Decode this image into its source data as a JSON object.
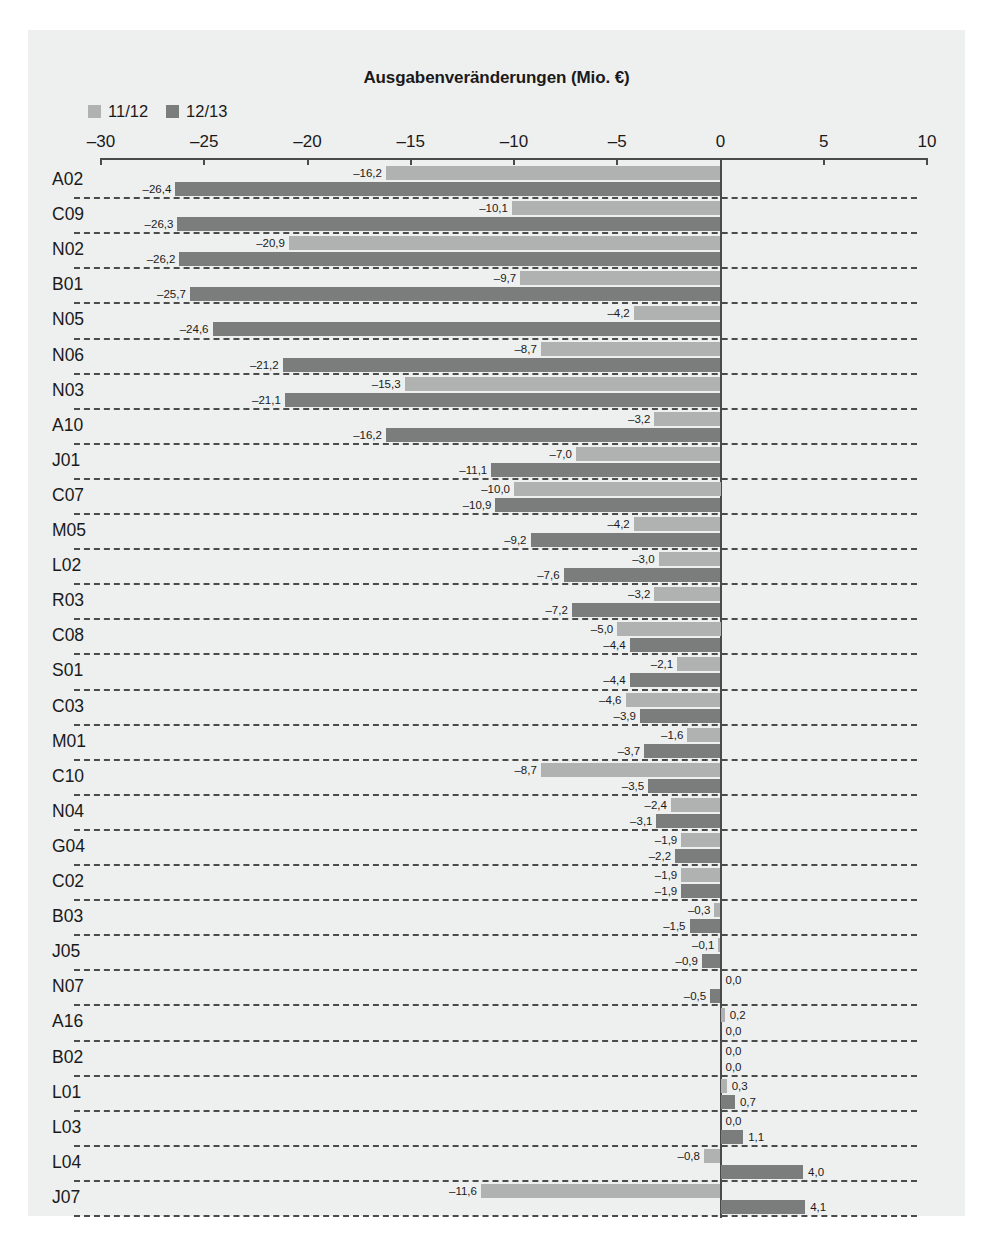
{
  "chart_data": {
    "type": "bar",
    "orientation": "horizontal",
    "title": "Ausgabenveränderungen (Mio. €)",
    "xlabel": "",
    "ylabel": "",
    "xlim": [
      -30,
      10
    ],
    "xticks": [
      -30,
      -25,
      -20,
      -15,
      -10,
      -5,
      0,
      5,
      10
    ],
    "xtick_labels": [
      "–30",
      "–25",
      "–20",
      "–15",
      "–10",
      "–5",
      "0",
      "5",
      "10"
    ],
    "grid": "horizontal-dashed",
    "legend_position": "top-left",
    "decimal_separator": ",",
    "categories": [
      "A02",
      "C09",
      "N02",
      "B01",
      "N05",
      "N06",
      "N03",
      "A10",
      "J01",
      "C07",
      "M05",
      "L02",
      "R03",
      "C08",
      "S01",
      "C03",
      "M01",
      "C10",
      "N04",
      "G04",
      "C02",
      "B03",
      "J05",
      "N07",
      "A16",
      "B02",
      "L01",
      "L03",
      "L04",
      "J07"
    ],
    "series": [
      {
        "name": "11/12",
        "color": "#b0b2b1",
        "values": [
          -16.2,
          -10.1,
          -20.9,
          -9.7,
          -4.2,
          -8.7,
          -15.3,
          -3.2,
          -7.0,
          -10.0,
          -4.2,
          -3.0,
          -3.2,
          -5.0,
          -2.1,
          -4.6,
          -1.6,
          -8.7,
          -2.4,
          -1.9,
          -1.9,
          -0.3,
          -0.1,
          0.0,
          0.2,
          0.0,
          0.3,
          0.0,
          -0.8,
          -11.6
        ],
        "labels": [
          "–16,2",
          "–10,1",
          "–20,9",
          "–9,7",
          "–4,2",
          "–8,7",
          "–15,3",
          "–3,2",
          "–7,0",
          "–10,0",
          "–4,2",
          "–3,0",
          "–3,2",
          "–5,0",
          "–2,1",
          "–4,6",
          "–1,6",
          "–8,7",
          "–2,4",
          "–1,9",
          "–1,9",
          "–0,3",
          "–0,1",
          "0,0",
          "0,2",
          "0,0",
          "0,3",
          "0,0",
          "–0,8",
          "–11,6"
        ]
      },
      {
        "name": "12/13",
        "color": "#7b7d7c",
        "values": [
          -26.4,
          -26.3,
          -26.2,
          -25.7,
          -24.6,
          -21.2,
          -21.1,
          -16.2,
          -11.1,
          -10.9,
          -9.2,
          -7.6,
          -7.2,
          -4.4,
          -4.4,
          -3.9,
          -3.7,
          -3.5,
          -3.1,
          -2.2,
          -1.9,
          -1.5,
          -0.9,
          -0.5,
          0.0,
          0.0,
          0.7,
          1.1,
          4.0,
          4.1
        ],
        "labels": [
          "–26,4",
          "–26,3",
          "–26,2",
          "–25,7",
          "–24,6",
          "–21,2",
          "–21,1",
          "–16,2",
          "–11,1",
          "–10,9",
          "–9,2",
          "–7,6",
          "–7,2",
          "–4,4",
          "–4,4",
          "–3,9",
          "–3,7",
          "–3,5",
          "–3,1",
          "–2,2",
          "–1,9",
          "–1,5",
          "–0,9",
          "–0,5",
          "0,0",
          "0,0",
          "0,7",
          "1,1",
          "4,0",
          "4,1"
        ]
      }
    ]
  },
  "legend": {
    "entries": [
      {
        "label": "11/12",
        "color": "#b0b2b1"
      },
      {
        "label": "12/13",
        "color": "#7b7d7c"
      }
    ]
  },
  "colors": {
    "panel_background": "#eef0ef",
    "page_background": "#ffffff",
    "axis": "#4a4a4a",
    "text": "#1a1a1a",
    "gridline": "#4b4b4b"
  }
}
